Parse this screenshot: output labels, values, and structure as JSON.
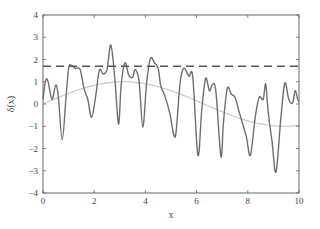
{
  "chart_data": {
    "type": "line",
    "title": "",
    "xlabel": "x",
    "ylabel": "δ(x)",
    "xlim": [
      0,
      10
    ],
    "ylim": [
      -4,
      4
    ],
    "xticks": [
      0,
      2,
      4,
      6,
      8,
      10
    ],
    "yticks": [
      -4,
      -3,
      -2,
      -1,
      0,
      1,
      2,
      3,
      4
    ],
    "grid": false,
    "legend": null,
    "series": [
      {
        "name": "noisy signal",
        "style": "solid",
        "color": "#6e6e6e",
        "x": [
          0.0,
          0.1,
          0.2,
          0.35,
          0.5,
          0.6,
          0.75,
          0.9,
          1.0,
          1.1,
          1.25,
          1.45,
          1.6,
          1.75,
          1.9,
          2.05,
          2.2,
          2.35,
          2.5,
          2.65,
          2.8,
          2.95,
          3.05,
          3.2,
          3.35,
          3.5,
          3.6,
          3.75,
          3.9,
          4.05,
          4.2,
          4.35,
          4.5,
          4.6,
          4.75,
          4.95,
          5.1,
          5.2,
          5.35,
          5.5,
          5.7,
          5.85,
          6.05,
          6.2,
          6.35,
          6.5,
          6.6,
          6.75,
          6.95,
          7.05,
          7.2,
          7.35,
          7.5,
          7.65,
          7.8,
          7.95,
          8.1,
          8.3,
          8.45,
          8.6,
          8.7,
          8.8,
          8.95,
          9.1,
          9.3,
          9.45,
          9.6,
          9.75,
          9.85,
          9.95,
          10.0
        ],
        "y": [
          0.2,
          1.05,
          1.0,
          0.2,
          0.85,
          0.3,
          -1.6,
          0.3,
          1.6,
          1.75,
          1.6,
          1.55,
          0.7,
          0.2,
          -0.6,
          0.3,
          1.5,
          1.35,
          1.55,
          2.65,
          1.2,
          -0.9,
          0.8,
          1.85,
          1.3,
          1.2,
          1.55,
          1.05,
          -1.05,
          1.0,
          2.05,
          1.85,
          1.6,
          0.8,
          0.4,
          -0.4,
          -1.35,
          -1.25,
          0.9,
          1.6,
          1.25,
          1.2,
          -2.3,
          -0.3,
          1.15,
          0.6,
          0.85,
          0.6,
          -2.35,
          -0.8,
          0.7,
          0.45,
          0.3,
          -0.3,
          -0.9,
          -1.5,
          -2.3,
          -0.5,
          0.3,
          0.2,
          0.9,
          -0.4,
          -1.7,
          -3.05,
          -0.5,
          0.95,
          0.2,
          0.05,
          0.6,
          0.2,
          0.1
        ]
      },
      {
        "name": "smooth reference",
        "style": "solid",
        "color": "#c4c4c4",
        "function": "sin(x/2)",
        "x": [
          0,
          1,
          2,
          3,
          4,
          5,
          6,
          7,
          8,
          9,
          10
        ],
        "y": [
          0.0,
          0.48,
          0.84,
          1.0,
          0.91,
          0.6,
          0.14,
          -0.35,
          -0.76,
          -0.98,
          -0.96
        ]
      },
      {
        "name": "threshold",
        "style": "dashed",
        "color": "#555555",
        "x": [
          0,
          10
        ],
        "y": [
          1.7,
          1.7
        ]
      }
    ]
  }
}
